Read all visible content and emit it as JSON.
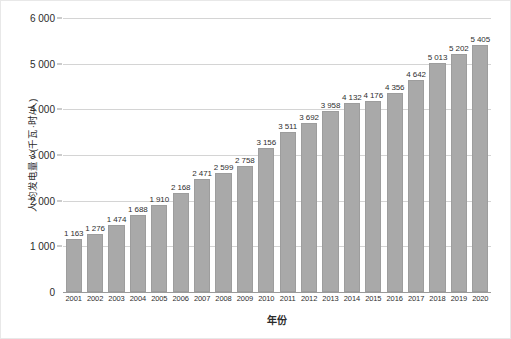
{
  "chart_data": {
    "type": "bar",
    "title": "",
    "xlabel": "年份",
    "ylabel": "人均发电量 / (千瓦·时/人)",
    "categories": [
      "2001",
      "2002",
      "2003",
      "2004",
      "2005",
      "2006",
      "2007",
      "2008",
      "2009",
      "2010",
      "2011",
      "2012",
      "2013",
      "2014",
      "2015",
      "2016",
      "2017",
      "2018",
      "2019",
      "2020"
    ],
    "values": [
      1163,
      1276,
      1474,
      1688,
      1910,
      2168,
      2471,
      2599,
      2758,
      3156,
      3511,
      3692,
      3958,
      4132,
      4176,
      4356,
      4642,
      5013,
      5202,
      5405
    ],
    "value_labels": [
      "1 163",
      "1 276",
      "1 474",
      "1 688",
      "1 910",
      "2 168",
      "2 471",
      "2 599",
      "2 758",
      "3 156",
      "3 511",
      "3 692",
      "3 958",
      "4 132",
      "4 176",
      "4 356",
      "4 642",
      "5 013",
      "5 202",
      "5 405"
    ],
    "ylim": [
      0,
      6000
    ],
    "yticks": [
      0,
      1000,
      2000,
      3000,
      4000,
      5000,
      6000
    ],
    "ytick_labels": [
      "0",
      "1 000",
      "2 000",
      "3 000",
      "4 000",
      "5 000",
      "6 000"
    ],
    "grid": true,
    "legend": null,
    "bar_color": "#a9a9a9",
    "grid_color": "#d4d4d4",
    "axis_color": "#9a9a9a",
    "text_color": "#2b2b2b"
  }
}
